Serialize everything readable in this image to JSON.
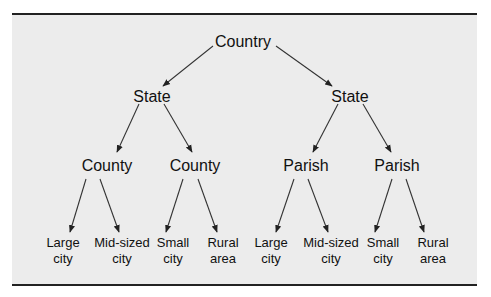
{
  "diagram": {
    "title": "",
    "root": {
      "label": "Country",
      "children": [
        {
          "label": "State",
          "children": [
            {
              "label": "County",
              "children": [
                {
                  "label": [
                    "Large",
                    "city"
                  ]
                },
                {
                  "label": [
                    "Mid-sized",
                    "city"
                  ]
                }
              ]
            },
            {
              "label": "County",
              "children": [
                {
                  "label": [
                    "Small",
                    "city"
                  ]
                },
                {
                  "label": [
                    "Rural",
                    "area"
                  ]
                }
              ]
            }
          ]
        },
        {
          "label": "State",
          "children": [
            {
              "label": "Parish",
              "children": [
                {
                  "label": [
                    "Large",
                    "city"
                  ]
                },
                {
                  "label": [
                    "Mid-sized",
                    "city"
                  ]
                }
              ]
            },
            {
              "label": "Parish",
              "children": [
                {
                  "label": [
                    "Small",
                    "city"
                  ]
                },
                {
                  "label": [
                    "Rural",
                    "area"
                  ]
                }
              ]
            }
          ]
        }
      ]
    },
    "colors": {
      "background": "#ececec",
      "ink": "#111111",
      "rule": "#222222"
    }
  }
}
